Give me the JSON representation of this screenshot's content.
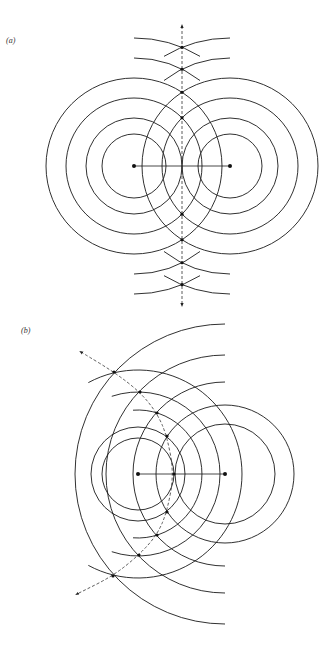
{
  "figure": {
    "panels": [
      {
        "id": "a",
        "label": "(a)",
        "description": "Two in-phase point sources; wavefronts intersect along a straight perpendicular bisector (dashed line with arrows)",
        "sources": 2,
        "wavefront_rings_per_source": 4,
        "extra_arcs_per_side": 2,
        "nodal_line": "straight"
      },
      {
        "id": "b",
        "label": "(b)",
        "description": "Two point sources with unequal wavefront spacing; intersections lie along a curved (hyperbolic) dashed line with arrows",
        "sources": 2,
        "wavefront_rings_left_source": 5,
        "wavefront_rings_right_source": 5,
        "nodal_line": "curved"
      }
    ]
  },
  "colors": {
    "line": "#1a1a1a",
    "background": "#ffffff"
  }
}
